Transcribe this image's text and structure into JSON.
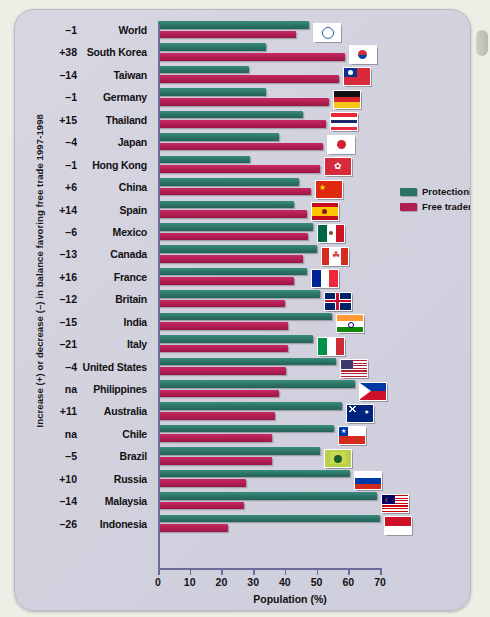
{
  "chart_data": {
    "type": "bar",
    "orientation": "horizontal",
    "title": "",
    "xlabel": "Population (%)",
    "ylabel": "Increase (+) or decrease (–) in balance favoring free trade 1997-1998",
    "xlim": [
      0,
      70
    ],
    "ticks": [
      0,
      10,
      20,
      30,
      40,
      50,
      60,
      70
    ],
    "grid": false,
    "legend_position": "right-upper",
    "series": [
      {
        "name": "Protectionists",
        "color": "#2b7367",
        "values": [
          47.5,
          34,
          28.7,
          34,
          45.8,
          38,
          29,
          44.6,
          43,
          49,
          50,
          47,
          51,
          55,
          49,
          56,
          62,
          58,
          55.5,
          51,
          60.5,
          69,
          70
        ]
      },
      {
        "name": "Free traders",
        "color": "#b11c52",
        "values": [
          43.6,
          59,
          57,
          54,
          53,
          52,
          51,
          48.4,
          47,
          47.4,
          45.8,
          43,
          40,
          41,
          41,
          40.5,
          38,
          37,
          36,
          36,
          27.7,
          27,
          22
        ]
      }
    ],
    "categories": [
      "World",
      "South Korea",
      "Taiwan",
      "Germany",
      "Thailand",
      "Japan",
      "Hong Kong",
      "China",
      "Spain",
      "Mexico",
      "Canada",
      "France",
      "Britain",
      "India",
      "Italy",
      "United States",
      "Philippines",
      "Australia",
      "Chile",
      "Brazil",
      "Russia",
      "Malaysia",
      "Indonesia"
    ],
    "deltas": [
      "–1",
      "+38",
      "–14",
      "–1",
      "+15",
      "–4",
      "–1",
      "+6",
      "+14",
      "–6",
      "–13",
      "+16",
      "–12",
      "–15",
      "–21",
      "–4",
      "na",
      "+11",
      "na",
      "–5",
      "+10",
      "–14",
      "–26"
    ],
    "flags": [
      "world-flag",
      "south-korea-flag",
      "taiwan-flag",
      "germany-flag",
      "thailand-flag",
      "japan-flag",
      "hong-kong-flag",
      "china-flag",
      "spain-flag",
      "mexico-flag",
      "canada-flag",
      "france-flag",
      "britain-flag",
      "india-flag",
      "italy-flag",
      "united-states-flag",
      "philippines-flag",
      "australia-flag",
      "chile-flag",
      "brazil-flag",
      "russia-flag",
      "malaysia-flag",
      "indonesia-flag"
    ]
  },
  "legend": {
    "items": [
      {
        "label": "Protectionists",
        "color": "#2b7367"
      },
      {
        "label": "Free traders",
        "color": "#b11c52"
      }
    ]
  },
  "axis": {
    "x_title": "Population (%)",
    "y_title": "Increase (+) or decrease (–) in balance favoring free trade 1997-1998",
    "tick_labels": [
      "0",
      "10",
      "20",
      "30",
      "40",
      "50",
      "60",
      "70"
    ]
  }
}
